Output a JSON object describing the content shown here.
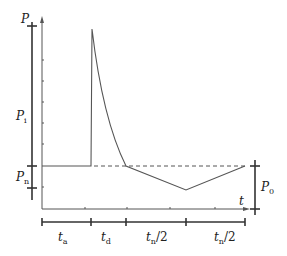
{
  "diagram": {
    "colors": {
      "line": "#555555",
      "bar": "#333333",
      "dashed": "#555555",
      "text": "#222222"
    },
    "y_axis": {
      "label": "P"
    },
    "x_axis": {
      "label": "t"
    },
    "left_scale": {
      "top_label": "P",
      "segments": [
        {
          "label": "P",
          "sub": "i"
        },
        {
          "label": "P",
          "sub": "n"
        }
      ]
    },
    "right_scale": {
      "label": "P",
      "sub": "0"
    },
    "time_segments": [
      {
        "label": "t",
        "sub": "a"
      },
      {
        "label": "t",
        "sub": "d"
      },
      {
        "label": "t",
        "sub": "n",
        "suffix": "/2"
      },
      {
        "label": "t",
        "sub": "n",
        "suffix": "/2"
      }
    ],
    "curve_points": [
      [
        42,
        166
      ],
      [
        91,
        166
      ],
      [
        92,
        29
      ],
      [
        126,
        166
      ],
      [
        186,
        190
      ],
      [
        245,
        166
      ]
    ]
  }
}
